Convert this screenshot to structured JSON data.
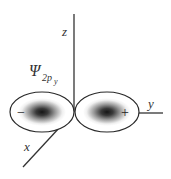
{
  "diagram": {
    "wavefunction_label": {
      "symbol": "Ψ",
      "subscript": "2p",
      "sub_subscript": "y"
    },
    "axes": {
      "z_label": "z",
      "y_label": "y",
      "x_label": "x"
    },
    "lobes": [
      {
        "position": "left",
        "sign": "−",
        "direction": "-y"
      },
      {
        "position": "right",
        "sign": "+",
        "direction": "+y"
      }
    ],
    "colors": {
      "axis": "#333333",
      "outline": "#2a2a2a",
      "lobe_core": "#1a1a1a",
      "lobe_edge": "#ffffff"
    }
  }
}
